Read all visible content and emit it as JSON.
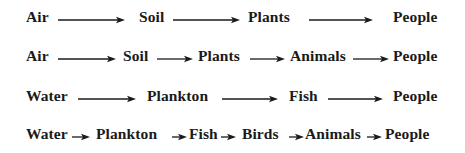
{
  "diagram": {
    "type": "food-chains",
    "colors": {
      "text": "#1a1a1a",
      "arrow": "#1a1a1a",
      "background": "#ffffff"
    },
    "chains": [
      {
        "id": "chain-1",
        "top": 9,
        "nodes": [
          {
            "label": "Air",
            "x": 26
          },
          {
            "label": "Soil",
            "x": 139
          },
          {
            "label": "Plants",
            "x": 248
          },
          {
            "label": "People",
            "x": 393
          }
        ],
        "arrows": [
          {
            "x1": 58,
            "x2": 125
          },
          {
            "x1": 173,
            "x2": 240
          },
          {
            "x1": 309,
            "x2": 373
          }
        ]
      },
      {
        "id": "chain-2",
        "top": 48,
        "nodes": [
          {
            "label": "Air",
            "x": 26
          },
          {
            "label": "Soil",
            "x": 123
          },
          {
            "label": "Plants",
            "x": 198
          },
          {
            "label": "Animals",
            "x": 290
          },
          {
            "label": "People",
            "x": 393
          }
        ],
        "arrows": [
          {
            "x1": 58,
            "x2": 116
          },
          {
            "x1": 157,
            "x2": 193
          },
          {
            "x1": 250,
            "x2": 285
          },
          {
            "x1": 353,
            "x2": 389
          }
        ]
      },
      {
        "id": "chain-3",
        "top": 88,
        "nodes": [
          {
            "label": "Water",
            "x": 26
          },
          {
            "label": "Plankton",
            "x": 147
          },
          {
            "label": "Fish",
            "x": 289
          },
          {
            "label": "People",
            "x": 393
          }
        ],
        "arrows": [
          {
            "x1": 78,
            "x2": 136
          },
          {
            "x1": 222,
            "x2": 278
          },
          {
            "x1": 328,
            "x2": 383
          }
        ]
      },
      {
        "id": "chain-4",
        "top": 126,
        "nodes": [
          {
            "label": "Water",
            "x": 26
          },
          {
            "label": "Plankton",
            "x": 96
          },
          {
            "label": "Fish",
            "x": 189
          },
          {
            "label": "Birds",
            "x": 242
          },
          {
            "label": "Animals",
            "x": 305
          },
          {
            "label": "People",
            "x": 385
          }
        ],
        "arrows": [
          {
            "x1": 72,
            "x2": 90
          },
          {
            "x1": 172,
            "x2": 187
          },
          {
            "x1": 221,
            "x2": 236
          },
          {
            "x1": 289,
            "x2": 304
          },
          {
            "x1": 367,
            "x2": 382
          }
        ]
      }
    ]
  }
}
